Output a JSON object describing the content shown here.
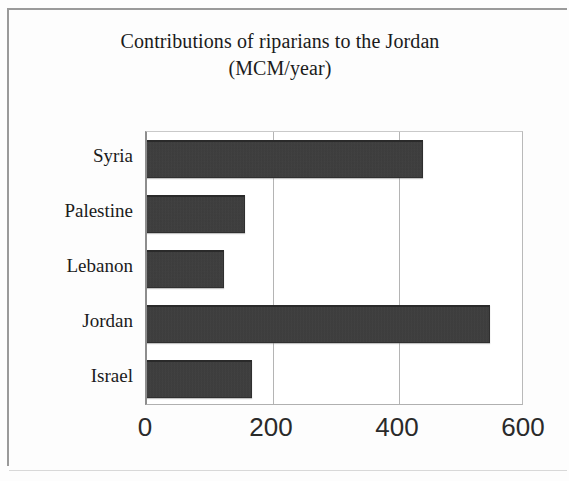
{
  "chart_data": {
    "type": "bar",
    "orientation": "horizontal",
    "title": "Contributions of riparians to the Jordan (MCM/year)",
    "title_lines": [
      "Contributions of riparians to the Jordan",
      "(MCM/year)"
    ],
    "xlabel": "",
    "ylabel": "",
    "categories": [
      "Syria",
      "Palestine",
      "Lebanon",
      "Jordan",
      "Israel"
    ],
    "values": [
      438,
      155,
      122,
      545,
      167
    ],
    "xlim": [
      0,
      600
    ],
    "xticks": [
      0,
      200,
      400,
      600
    ],
    "xtick_labels": [
      "0",
      "200",
      "400",
      "600"
    ],
    "grid": true,
    "grid_axis": "x",
    "legend": false,
    "bar_color": "#3b3b3b",
    "background_color": "#ffffff",
    "axis_color": "#8d8d8d",
    "text_color": "#1b1b1b"
  },
  "frame": {
    "border_color": "#9a9a9a"
  }
}
